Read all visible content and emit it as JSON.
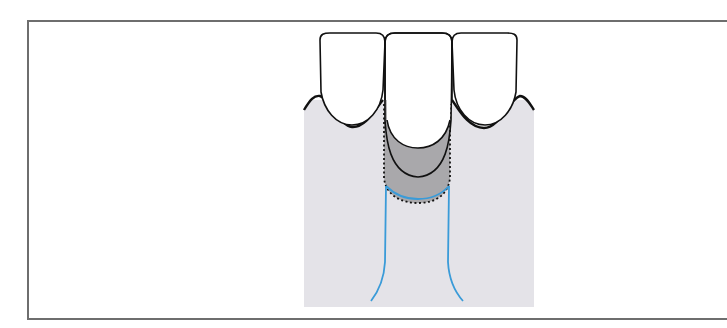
{
  "figure": {
    "elements": [
      {
        "name": "left-abutment-tooth",
        "type": "tooth-crown"
      },
      {
        "name": "pontic-tooth",
        "type": "pontic-crown"
      },
      {
        "name": "right-abutment-tooth",
        "type": "tooth-crown"
      },
      {
        "name": "gingiva",
        "type": "soft-tissue"
      },
      {
        "name": "pontic-socket",
        "type": "ovate-pontic-recess"
      },
      {
        "name": "dotted-outline",
        "type": "dotted-contour"
      },
      {
        "name": "bone-outline",
        "type": "blue-contour"
      }
    ],
    "colors": {
      "frame": "#6e6e6e",
      "background": "#ffffff",
      "soft_tissue": "#e4e3e8",
      "pontic_recess": "#a9a8ab",
      "tooth": "#ffffff",
      "tooth_outline": "#111111",
      "bone_line": "#3a9bd8"
    }
  }
}
